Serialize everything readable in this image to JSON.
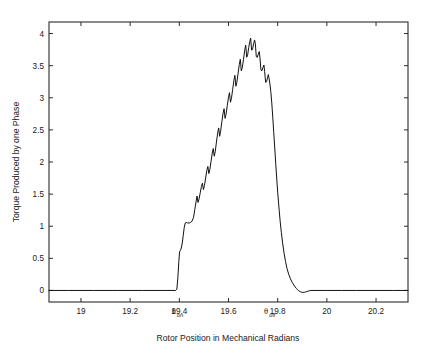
{
  "chart_data": {
    "type": "line",
    "title": "",
    "xlabel": "Rotor Position in Mechanical Radians",
    "ylabel": "Torque Produced by one Phase",
    "xlim": [
      18.87,
      20.33
    ],
    "ylim": [
      -0.18,
      4.18
    ],
    "grid": false,
    "legend": null,
    "xticks": [
      19,
      19.2,
      19.4,
      19.6,
      19.8,
      20,
      20.2
    ],
    "xticklabels": [
      "19",
      "19.2",
      "19.4",
      "19.6",
      "19.8",
      "20",
      "20.2"
    ],
    "yticks": [
      0,
      0.5,
      1,
      1.5,
      2,
      2.5,
      3,
      3.5,
      4
    ],
    "yticklabels": [
      "0",
      "0.5",
      "1",
      "1.5",
      "2",
      "2.5",
      "3",
      "3.5",
      "4"
    ],
    "annotations": [
      {
        "name": "theta-on",
        "symbol": "θ",
        "subscript": "on",
        "x": 19.39,
        "label": "θon"
      },
      {
        "name": "theta-off",
        "symbol": "θ",
        "subscript": "off",
        "x": 19.765,
        "label": "θoff"
      }
    ],
    "series": [
      {
        "name": "Torque produced by one phase",
        "color": "#111111",
        "points": [
          [
            18.87,
            0.0
          ],
          [
            18.95,
            0.0
          ],
          [
            19.05,
            0.0
          ],
          [
            19.15,
            0.0
          ],
          [
            19.25,
            0.0
          ],
          [
            19.33,
            0.0
          ],
          [
            19.37,
            0.0
          ],
          [
            19.385,
            0.0
          ],
          [
            19.39,
            0.02
          ],
          [
            19.394,
            0.2
          ],
          [
            19.398,
            0.45
          ],
          [
            19.401,
            0.6
          ],
          [
            19.404,
            0.62
          ],
          [
            19.408,
            0.66
          ],
          [
            19.412,
            0.74
          ],
          [
            19.416,
            0.86
          ],
          [
            19.42,
            0.98
          ],
          [
            19.424,
            1.05
          ],
          [
            19.428,
            1.06
          ],
          [
            19.434,
            1.05
          ],
          [
            19.44,
            1.05
          ],
          [
            19.446,
            1.06
          ],
          [
            19.452,
            1.08
          ],
          [
            19.458,
            1.14
          ],
          [
            19.463,
            1.26
          ],
          [
            19.468,
            1.38
          ],
          [
            19.472,
            1.47
          ],
          [
            19.476,
            1.37
          ],
          [
            19.48,
            1.42
          ],
          [
            19.485,
            1.52
          ],
          [
            19.49,
            1.62
          ],
          [
            19.494,
            1.67
          ],
          [
            19.498,
            1.57
          ],
          [
            19.502,
            1.63
          ],
          [
            19.507,
            1.75
          ],
          [
            19.512,
            1.87
          ],
          [
            19.516,
            1.93
          ],
          [
            19.52,
            1.82
          ],
          [
            19.524,
            1.88
          ],
          [
            19.529,
            2.01
          ],
          [
            19.534,
            2.14
          ],
          [
            19.538,
            2.21
          ],
          [
            19.542,
            2.09
          ],
          [
            19.546,
            2.16
          ],
          [
            19.551,
            2.31
          ],
          [
            19.556,
            2.45
          ],
          [
            19.56,
            2.53
          ],
          [
            19.564,
            2.4
          ],
          [
            19.568,
            2.48
          ],
          [
            19.573,
            2.63
          ],
          [
            19.578,
            2.76
          ],
          [
            19.582,
            2.83
          ],
          [
            19.586,
            2.68
          ],
          [
            19.59,
            2.74
          ],
          [
            19.595,
            2.88
          ],
          [
            19.6,
            3.01
          ],
          [
            19.604,
            3.08
          ],
          [
            19.608,
            2.93
          ],
          [
            19.612,
            2.99
          ],
          [
            19.617,
            3.13
          ],
          [
            19.622,
            3.27
          ],
          [
            19.626,
            3.35
          ],
          [
            19.63,
            3.18
          ],
          [
            19.634,
            3.24
          ],
          [
            19.639,
            3.38
          ],
          [
            19.644,
            3.52
          ],
          [
            19.648,
            3.6
          ],
          [
            19.652,
            3.42
          ],
          [
            19.656,
            3.47
          ],
          [
            19.661,
            3.6
          ],
          [
            19.666,
            3.74
          ],
          [
            19.67,
            3.82
          ],
          [
            19.674,
            3.63
          ],
          [
            19.678,
            3.67
          ],
          [
            19.682,
            3.78
          ],
          [
            19.687,
            3.88
          ],
          [
            19.69,
            3.93
          ],
          [
            19.694,
            3.74
          ],
          [
            19.698,
            3.76
          ],
          [
            19.702,
            3.84
          ],
          [
            19.706,
            3.9
          ],
          [
            19.709,
            3.85
          ],
          [
            19.713,
            3.64
          ],
          [
            19.717,
            3.63
          ],
          [
            19.721,
            3.68
          ],
          [
            19.725,
            3.72
          ],
          [
            19.728,
            3.62
          ],
          [
            19.732,
            3.43
          ],
          [
            19.736,
            3.42
          ],
          [
            19.74,
            3.47
          ],
          [
            19.744,
            3.51
          ],
          [
            19.747,
            3.41
          ],
          [
            19.751,
            3.24
          ],
          [
            19.755,
            3.25
          ],
          [
            19.759,
            3.32
          ],
          [
            19.762,
            3.36
          ],
          [
            19.765,
            3.3
          ],
          [
            19.768,
            3.23
          ],
          [
            19.772,
            3.1
          ],
          [
            19.776,
            2.92
          ],
          [
            19.78,
            2.7
          ],
          [
            19.784,
            2.46
          ],
          [
            19.788,
            2.22
          ],
          [
            19.792,
            1.98
          ],
          [
            19.796,
            1.75
          ],
          [
            19.8,
            1.53
          ],
          [
            19.805,
            1.3
          ],
          [
            19.81,
            1.08
          ],
          [
            19.815,
            0.9
          ],
          [
            19.82,
            0.74
          ],
          [
            19.826,
            0.58
          ],
          [
            19.832,
            0.45
          ],
          [
            19.838,
            0.34
          ],
          [
            19.845,
            0.25
          ],
          [
            19.852,
            0.18
          ],
          [
            19.86,
            0.12
          ],
          [
            19.868,
            0.07
          ],
          [
            19.876,
            0.03
          ],
          [
            19.884,
            0.0
          ],
          [
            19.892,
            -0.02
          ],
          [
            19.9,
            -0.03
          ],
          [
            19.908,
            -0.03
          ],
          [
            19.916,
            -0.02
          ],
          [
            19.924,
            -0.01
          ],
          [
            19.935,
            0.0
          ],
          [
            19.96,
            0.0
          ],
          [
            20.0,
            0.0
          ],
          [
            20.06,
            0.0
          ],
          [
            20.12,
            0.0
          ],
          [
            20.2,
            0.0
          ],
          [
            20.27,
            0.0
          ],
          [
            20.33,
            0.0
          ]
        ]
      }
    ]
  },
  "figure": {
    "background_color": "#ffffff",
    "axis_color": "#2b2b2b",
    "curve_color": "#111111"
  }
}
